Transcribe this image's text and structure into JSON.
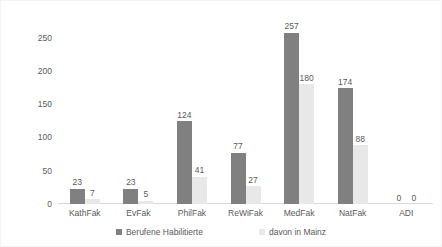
{
  "chart_data": {
    "type": "bar",
    "title": "",
    "subtitle": "",
    "xlabel": "",
    "ylabel": "",
    "ylim": [
      0,
      275
    ],
    "yticks": [
      0,
      50,
      100,
      150,
      200,
      250
    ],
    "grid": false,
    "legend_position": "bottom",
    "categories": [
      "KathFak",
      "EvFak",
      "PhilFak",
      "ReWiFak",
      "MedFak",
      "NatFak",
      "ADI"
    ],
    "series": [
      {
        "name": "Berufene Habilitierte",
        "color": "#808080",
        "values": [
          23,
          23,
          124,
          77,
          257,
          174,
          0
        ]
      },
      {
        "name": "davon in Mainz",
        "color": "#e8e8e8",
        "values": [
          7,
          5,
          41,
          27,
          180,
          88,
          0
        ]
      }
    ]
  },
  "legend": {
    "items": [
      {
        "label": "Berufene Habilitierte",
        "swatch": "legend-swatch-dark"
      },
      {
        "label": "davon in Mainz",
        "swatch": "legend-swatch-light"
      }
    ]
  }
}
